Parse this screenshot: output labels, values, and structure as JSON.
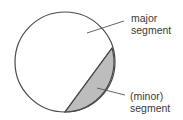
{
  "diagram": {
    "circle": {
      "cx": 65,
      "cy": 62,
      "r": 50,
      "stroke": "#4a4a4a",
      "fill": "#ffffff"
    },
    "chord": {
      "x1": 112,
      "y1": 48,
      "x2": 65,
      "y2": 112
    },
    "minor_segment_fill": "#bdbdbd",
    "labels": {
      "major": {
        "line1": "major",
        "line2": "segment"
      },
      "minor": {
        "line1": "(minor)",
        "line2": "segment"
      }
    },
    "leaders": {
      "major": {
        "x1": 87,
        "y1": 33,
        "x2": 124,
        "y2": 21
      },
      "minor": {
        "x1": 97,
        "y1": 88,
        "x2": 125,
        "y2": 95
      }
    }
  }
}
